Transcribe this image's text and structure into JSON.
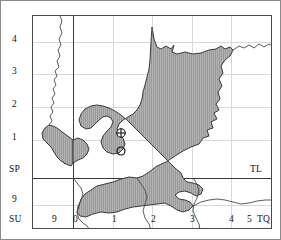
{
  "map": {
    "type": "grid-reference-map",
    "region": "South East England / Thames Estuary",
    "grid_system": "British National Grid",
    "shaded_area_label": "study area",
    "colors": {
      "shaded_fill": "#a9a9a9",
      "hatch_line": "#8e8e8e",
      "coastline": "#3a3a3a",
      "grid_minor": "#d8d8d8",
      "grid_major": "#3a3a3a",
      "frame": "#4a4a4a"
    }
  },
  "axes": {
    "y_labels": [
      {
        "text": "4",
        "y": 40
      },
      {
        "text": "3",
        "y": 72
      },
      {
        "text": "2",
        "y": 105
      },
      {
        "text": "1",
        "y": 138
      },
      {
        "text": "SP",
        "y": 170
      },
      {
        "text": "9",
        "y": 199
      },
      {
        "text": "SU",
        "y": 220
      }
    ],
    "x_labels": [
      {
        "text": "9",
        "x": 53
      },
      {
        "text": "0",
        "x": 74
      },
      {
        "text": "1",
        "x": 113
      },
      {
        "text": "2",
        "x": 152
      },
      {
        "text": "3",
        "x": 191
      },
      {
        "text": "4",
        "x": 230
      },
      {
        "text": "5",
        "x": 263
      },
      {
        "text": "TQ",
        "x": 272
      }
    ],
    "square_labels": [
      {
        "text": "TL",
        "x": 250,
        "y": 170
      },
      {
        "text": "SP",
        "x": 34,
        "y": 170
      },
      {
        "text": "SU",
        "x": 34,
        "y": 220
      },
      {
        "text": "TQ",
        "x": 272,
        "y": 220
      }
    ]
  },
  "markers": [
    {
      "name": "crossed-circle-marker",
      "symbol": "crossed-circle",
      "x": 120,
      "y": 132
    },
    {
      "name": "open-circle-marker",
      "symbol": "open-circle",
      "x": 120,
      "y": 150
    }
  ]
}
